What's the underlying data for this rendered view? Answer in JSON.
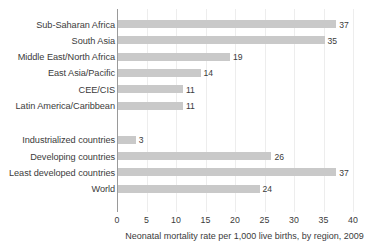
{
  "chart_data": {
    "type": "bar",
    "orientation": "horizontal",
    "title": "",
    "xlabel": "Neonatal mortality rate per 1,000 live births, by region, 2009",
    "ylabel": "",
    "xlim": [
      0,
      40
    ],
    "xticks": [
      0,
      5,
      10,
      15,
      20,
      25,
      30,
      35,
      40
    ],
    "grid": true,
    "legend": "none",
    "bar_color": "#c9c9c9",
    "axis_color": "#9a9a9a",
    "text_color": "#3b3b3b",
    "groups": [
      {
        "name": "regions",
        "categories": [
          "Sub-Saharan Africa",
          "South Asia",
          "Middle East/North Africa",
          "East Asia/Pacific",
          "CEE/CIS",
          "Latin America/Caribbean"
        ],
        "values": [
          37,
          35,
          19,
          14,
          11,
          11
        ]
      },
      {
        "name": "aggregates",
        "categories": [
          "Industrialized countries",
          "Developing countries",
          "Least developed countries",
          "World"
        ],
        "values": [
          3,
          26,
          37,
          24
        ]
      }
    ],
    "categories": [
      "Sub-Saharan Africa",
      "South Asia",
      "Middle East/North Africa",
      "East Asia/Pacific",
      "CEE/CIS",
      "Latin America/Caribbean",
      "Industrialized countries",
      "Developing countries",
      "Least developed countries",
      "World"
    ],
    "values": [
      37,
      35,
      19,
      14,
      11,
      11,
      3,
      26,
      37,
      24
    ],
    "value_labels": [
      "37",
      "35",
      "19",
      "14",
      "11",
      "11",
      "3",
      "26",
      "37",
      "24"
    ],
    "tick_labels": [
      "0",
      "5",
      "10",
      "15",
      "20",
      "25",
      "30",
      "35",
      "40"
    ]
  }
}
